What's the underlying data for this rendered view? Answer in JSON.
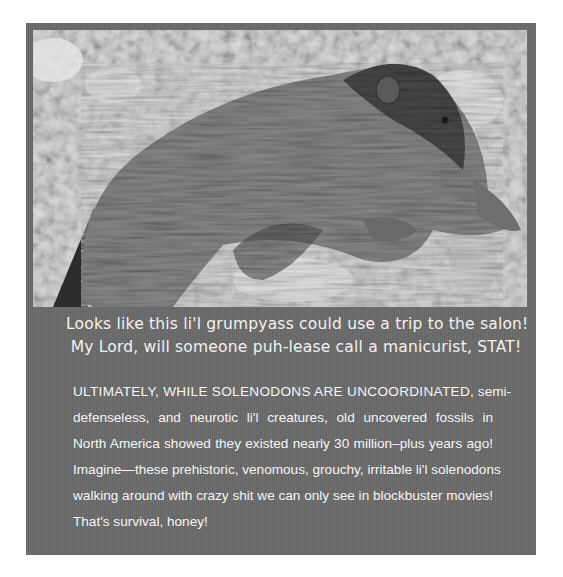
{
  "photo": {
    "subject": "solenodon lying on rocks",
    "style": "grayscale photograph"
  },
  "caption": {
    "lines": [
      "Looks like this li'l grumpyass could use a trip to the salon!",
      "My Lord, will someone puh-lease call a manicurist, STAT!"
    ]
  },
  "body": {
    "lead_caps": "ULTIMATELY, WHILE SOLENODONS ARE UNCOORDINATED,",
    "lines": [
      " semi-",
      "defenseless, and neurotic li'l creatures, old uncovered fossils in",
      "North America showed they existed nearly 30 million–plus years ago!",
      "Imagine—these prehistoric, venomous, grouchy, irritable li'l solenodons",
      "walking around with crazy shit we can only see in blockbuster movies!",
      "That's survival, honey!"
    ]
  },
  "colors": {
    "panel": "#6b6b6b",
    "text": "#f5f5f5",
    "page": "#ffffff"
  }
}
